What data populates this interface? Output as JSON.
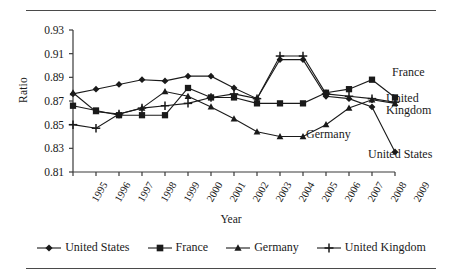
{
  "chart_data": {
    "type": "line",
    "title": "",
    "xlabel": "Year",
    "ylabel": "Ratio",
    "x": [
      1995,
      1996,
      1997,
      1998,
      1999,
      2000,
      2001,
      2002,
      2003,
      2004,
      2005,
      2006,
      2007,
      2008,
      2009
    ],
    "categories": [
      "1995",
      "1996",
      "1997",
      "1998",
      "1999",
      "2000",
      "2001",
      "2002",
      "2003",
      "2004",
      "2005",
      "2006",
      "2007",
      "2008",
      "2009"
    ],
    "ylim": [
      0.81,
      0.93
    ],
    "yticks": [
      0.81,
      0.83,
      0.85,
      0.87,
      0.89,
      0.91,
      0.93
    ],
    "ytick_labels": [
      "0.81",
      "0.83",
      "0.85",
      "0.87",
      "0.89",
      "0.91",
      "0.93"
    ],
    "grid": false,
    "legend_position": "bottom",
    "series": [
      {
        "name": "United States",
        "marker": "diamond",
        "values": [
          0.876,
          0.88,
          0.884,
          0.888,
          0.887,
          0.891,
          0.891,
          0.881,
          0.872,
          0.905,
          0.905,
          0.874,
          0.872,
          0.865,
          0.827
        ]
      },
      {
        "name": "France",
        "marker": "square",
        "values": [
          0.866,
          0.862,
          0.858,
          0.858,
          0.858,
          0.881,
          0.873,
          0.873,
          0.868,
          0.868,
          0.868,
          0.877,
          0.88,
          0.888,
          0.873
        ]
      },
      {
        "name": "Germany",
        "marker": "triangle",
        "values": [
          0.877,
          0.861,
          0.859,
          0.864,
          0.878,
          0.874,
          0.865,
          0.855,
          0.844,
          0.84,
          0.84,
          0.85,
          0.864,
          0.871,
          0.868
        ]
      },
      {
        "name": "United Kingdom",
        "marker": "plus",
        "values": [
          0.85,
          0.847,
          0.859,
          0.864,
          0.866,
          0.868,
          0.873,
          0.876,
          0.872,
          0.908,
          0.908,
          0.876,
          0.874,
          0.872,
          0.869
        ]
      }
    ],
    "annotations": [
      {
        "text": "France",
        "series": "France"
      },
      {
        "text": "United\nKingdom",
        "series": "United Kingdom"
      },
      {
        "text": "Germany",
        "series": "Germany"
      },
      {
        "text": "United States",
        "series": "United States"
      }
    ]
  },
  "annotations": {
    "france": "France",
    "uk_line1": "United",
    "uk_line2": "Kingdom",
    "germany": "Germany",
    "united_states": "United States"
  },
  "legend": {
    "items": [
      {
        "label": "United States",
        "marker": "diamond"
      },
      {
        "label": "France",
        "marker": "square"
      },
      {
        "label": "Germany",
        "marker": "triangle"
      },
      {
        "label": "United Kingdom",
        "marker": "plus"
      }
    ]
  },
  "style": {
    "line_color": "#1a1a1a",
    "axis_color": "#3a3a3a",
    "background": "#ffffff"
  }
}
